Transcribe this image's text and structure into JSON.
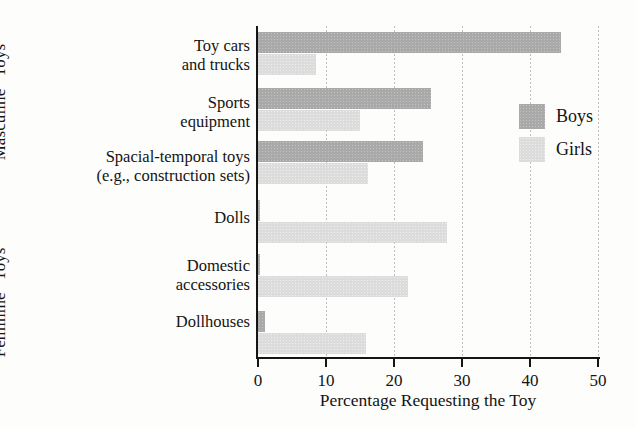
{
  "chart_data": {
    "type": "bar",
    "orientation": "horizontal",
    "title": "",
    "xlabel": "Percentage Requesting the Toy",
    "ylabel": "",
    "xlim": [
      0,
      50
    ],
    "xticks": [
      0,
      10,
      20,
      30,
      40,
      50
    ],
    "xtick_labels": [
      "0",
      "10",
      "20",
      "30",
      "40",
      "50"
    ],
    "grid": true,
    "grid_axis": "x",
    "legend_position": "upper right",
    "categories": [
      "Toy cars and trucks",
      "Sports equipment",
      "Spacial-temporal toys (e.g., construction sets)",
      "Dolls",
      "Domestic accessories",
      "Dollhouses"
    ],
    "category_lines": [
      [
        "Toy cars",
        "and trucks"
      ],
      [
        "Sports",
        "equipment"
      ],
      [
        "Spacial-temporal toys",
        "(e.g., construction sets)"
      ],
      [
        "Dolls"
      ],
      [
        "Domestic",
        "accessories"
      ],
      [
        "Dollhouses"
      ]
    ],
    "series": [
      {
        "name": "Boys",
        "color": "#a9a9a9",
        "values": [
          44.5,
          25.5,
          24.3,
          0.3,
          0.3,
          1.0
        ]
      },
      {
        "name": "Girls",
        "color": "#dcdcdc",
        "values": [
          8.6,
          15.0,
          16.2,
          27.8,
          22.0,
          15.9
        ]
      }
    ],
    "group_labels": [
      {
        "text": "“Masculine” Toys",
        "categories": [
          "Toy cars and trucks",
          "Sports equipment",
          "Spacial-temporal toys (e.g., construction sets)"
        ]
      },
      {
        "text": "“Feminine” Toys",
        "categories": [
          "Dolls",
          "Domestic accessories",
          "Dollhouses"
        ]
      }
    ]
  },
  "legend": {
    "items": [
      {
        "label": "Boys",
        "color": "#a9a9a9"
      },
      {
        "label": "Girls",
        "color": "#dcdcdc"
      }
    ]
  },
  "axis": {
    "x_title": "Percentage Requesting the Toy"
  },
  "colors": {
    "boys": "#a9a9a9",
    "girls": "#dcdcdc",
    "axis": "#151515",
    "grid": "#bcbcbc",
    "background": "#fdfdfb"
  }
}
